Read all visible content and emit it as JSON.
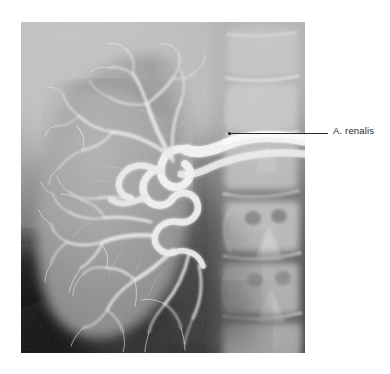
{
  "figure": {
    "type": "renal-arteriogram-radiograph",
    "background_color": "#ffffff"
  },
  "radiograph": {
    "alt_text": "Renal arteriogram showing kidney with arborizing arterial tree and lumbar vertebrae",
    "frame": {
      "x": 21,
      "y": 22,
      "width": 284,
      "height": 331
    },
    "tones": {
      "plate_base": "#a8a8a8",
      "upper_left_soft_tissue": "#b8b8b8",
      "kidney_parenchyma": "#9a9a9a",
      "vessel_contrast": "#f2f2f2",
      "vertebral_bone": "#cfcfcf",
      "lower_left_dark": "#0d0d0d"
    }
  },
  "annotations": [
    {
      "id": "a-renalis",
      "label": "A. renalis",
      "label_x": 333,
      "label_y": 126,
      "line_start_x": 229,
      "line_start_y": 133,
      "line_end_x": 328,
      "line_end_y": 133,
      "dot_x": 228,
      "dot_y": 132,
      "line_color": "#2b2b2b",
      "text_color": "#1f1f1f"
    }
  ]
}
